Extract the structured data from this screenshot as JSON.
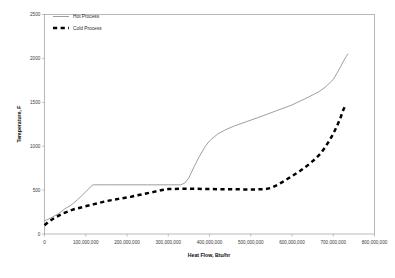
{
  "chart_data": {
    "type": "line",
    "title": "",
    "xlabel": "Heat Flow, Btu/hr",
    "ylabel": "Temperature, F",
    "xlim": [
      0,
      800000000
    ],
    "ylim": [
      0,
      2500
    ],
    "grid": false,
    "legend_position": "top-left-inside",
    "xticks": [
      0,
      100000000,
      200000000,
      300000000,
      400000000,
      500000000,
      600000000,
      700000000,
      800000000
    ],
    "xtick_labels": [
      "0",
      "100,000,000",
      "200,000,000",
      "300,000,000",
      "400,000,000",
      "500,000,000",
      "600,000,000",
      "700,000,000",
      "800,000,000"
    ],
    "yticks": [
      0,
      500,
      1000,
      1500,
      2000,
      2500
    ],
    "ytick_labels": [
      "0",
      "500",
      "1000",
      "1500",
      "2000",
      "2500"
    ],
    "series": [
      {
        "name": "Hot Process",
        "style": "solid-thin",
        "color": "#8c8c8c",
        "x": [
          0,
          8000000,
          20000000,
          35000000,
          50000000,
          62000000,
          80000000,
          100000000,
          112000000,
          118000000,
          150000000,
          200000000,
          250000000,
          300000000,
          330000000,
          340000000,
          350000000,
          362000000,
          375000000,
          390000000,
          400000000,
          420000000,
          440000000,
          460000000,
          490000000,
          520000000,
          560000000,
          600000000,
          640000000,
          665000000,
          680000000,
          700000000,
          715000000,
          725000000,
          732000000,
          736000000
        ],
        "y": [
          150,
          165,
          195,
          235,
          290,
          320,
          390,
          480,
          540,
          560,
          560,
          560,
          560,
          560,
          560,
          580,
          640,
          760,
          880,
          1000,
          1060,
          1140,
          1190,
          1230,
          1280,
          1330,
          1400,
          1470,
          1560,
          1620,
          1670,
          1760,
          1880,
          1970,
          2025,
          2050
        ]
      },
      {
        "name": "Cold Process",
        "style": "dashed-thick",
        "color": "#000000",
        "x": [
          0,
          10000000,
          25000000,
          45000000,
          70000000,
          95000000,
          120000000,
          150000000,
          180000000,
          210000000,
          240000000,
          265000000,
          285000000,
          300000000,
          330000000,
          360000000,
          400000000,
          440000000,
          480000000,
          510000000,
          535000000,
          550000000,
          565000000,
          580000000,
          600000000,
          620000000,
          640000000,
          655000000,
          668000000,
          680000000,
          690000000,
          700000000,
          710000000,
          718000000,
          724000000,
          728000000
        ],
        "y": [
          100,
          140,
          185,
          235,
          280,
          310,
          340,
          375,
          400,
          425,
          455,
          480,
          500,
          512,
          515,
          515,
          512,
          510,
          508,
          508,
          512,
          525,
          560,
          600,
          660,
          720,
          790,
          850,
          910,
          985,
          1060,
          1140,
          1240,
          1330,
          1410,
          1450
        ]
      }
    ]
  },
  "legend": {
    "items": [
      {
        "label": "Hot Process"
      },
      {
        "label": "Cold Process"
      }
    ]
  }
}
